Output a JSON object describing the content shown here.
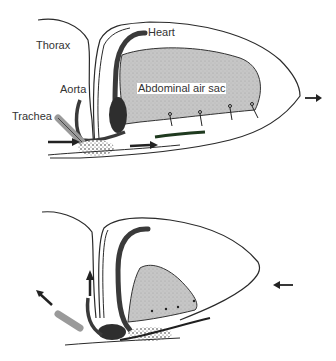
{
  "diagram": {
    "panels": [
      {
        "id": "inspiration",
        "labels": {
          "thorax": "Thorax",
          "heart": "Heart",
          "aorta": "Aorta",
          "trachea": "Trachea",
          "abdominal_air_sac": "Abdominal air sac"
        },
        "arrows": [
          "air-in-left",
          "air-flow-right",
          "body-expand-right"
        ]
      },
      {
        "id": "expiration",
        "arrows": [
          "air-out-up",
          "air-out-upper-left",
          "body-compress-left"
        ]
      }
    ],
    "colors": {
      "outline": "#2a2a2a",
      "air_sac_fill": "#c8c8c8",
      "vessel": "#3a3a3a",
      "trachea": "#9a9a9a"
    }
  }
}
